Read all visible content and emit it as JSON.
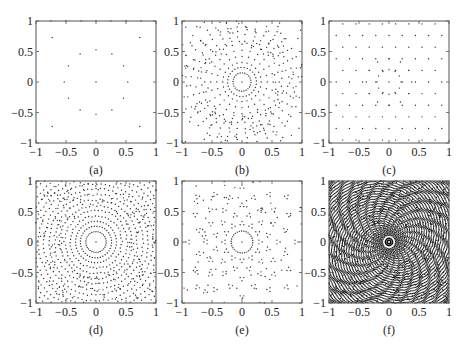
{
  "chart_data": [
    {
      "id": "a",
      "type": "scatter",
      "caption": "(a)",
      "xlim": [
        -1,
        1
      ],
      "ylim": [
        -1,
        1
      ],
      "xticks": [
        "-1",
        "-0.5",
        "0",
        "0.5",
        "1"
      ],
      "yticks": [
        "1",
        "0.5",
        "0",
        "-0.5",
        "-1"
      ],
      "grid": false,
      "description": "Center point, 12 points on ring r=0.53 at 30-degree spacing, 4 corner points",
      "points": [
        [
          0,
          0
        ],
        [
          0,
          0.53
        ],
        [
          0.265,
          0.459
        ],
        [
          0.459,
          0.265
        ],
        [
          0.53,
          0
        ],
        [
          0.459,
          -0.265
        ],
        [
          0.265,
          -0.459
        ],
        [
          0,
          -0.53
        ],
        [
          -0.265,
          -0.459
        ],
        [
          -0.459,
          -0.265
        ],
        [
          -0.53,
          0
        ],
        [
          -0.459,
          0.265
        ],
        [
          -0.265,
          0.459
        ],
        [
          0.73,
          0.73
        ],
        [
          -0.73,
          0.73
        ],
        [
          0.73,
          -0.73
        ],
        [
          -0.73,
          -0.73
        ],
        [
          -0.5,
          1
        ],
        [
          0,
          1
        ],
        [
          0.5,
          1
        ],
        [
          -0.25,
          1
        ],
        [
          0.25,
          1
        ],
        [
          -0.75,
          1
        ],
        [
          0.75,
          1
        ]
      ],
      "pattern": {
        "kind": "explicit"
      }
    },
    {
      "id": "b",
      "type": "scatter",
      "caption": "(b)",
      "xlim": [
        -1,
        1
      ],
      "ylim": [
        -1,
        1
      ],
      "xticks": [
        "-1",
        "-0.5",
        "0",
        "0.5",
        "1"
      ],
      "yticks": [
        "1",
        "0.5",
        "0",
        "-0.5",
        "-1"
      ],
      "grid": false,
      "description": "Center point, dense inner ring, radial spokes, outer scattered points",
      "pattern": {
        "kind": "rings_spokes",
        "rings": [
          [
            0.15,
            24
          ],
          [
            0.24,
            28
          ]
        ],
        "spokes": 24,
        "spoke_r": [
          0.32,
          0.62
        ],
        "spoke_pts": 4,
        "outer_spokes": 36,
        "outer_r": [
          0.68,
          1.0
        ],
        "outer_pts": 5,
        "scatter": 180,
        "seed": 7
      }
    },
    {
      "id": "c",
      "type": "scatter",
      "caption": "(c)",
      "xlim": [
        -1,
        1
      ],
      "ylim": [
        -1,
        1
      ],
      "xticks": [
        "-1",
        "-0.5",
        "0",
        "0.5",
        "1"
      ],
      "yticks": [
        "1",
        "0.5",
        "0",
        "-0.5",
        "-1"
      ],
      "grid": false,
      "description": "Sparse quasi-periodic 12-fold point pattern",
      "pattern": {
        "kind": "quasi",
        "step": 0.22,
        "fold": 12,
        "seed": 3
      }
    },
    {
      "id": "d",
      "type": "scatter",
      "caption": "(d)",
      "xlim": [
        -1,
        1
      ],
      "ylim": [
        -1,
        1
      ],
      "xticks": [
        "-1",
        "-0.5",
        "0",
        "0.5",
        "1"
      ],
      "yticks": [
        "1",
        "0.5",
        "0",
        "-0.5",
        "-1"
      ],
      "grid": false,
      "description": "Concentric rings of points with increasing density outward",
      "pattern": {
        "kind": "rings_spokes",
        "rings": [
          [
            0.17,
            30
          ],
          [
            0.26,
            36
          ],
          [
            0.34,
            42
          ],
          [
            0.43,
            48
          ],
          [
            0.52,
            54
          ],
          [
            0.6,
            60
          ],
          [
            0.69,
            66
          ],
          [
            0.78,
            72
          ],
          [
            0.87,
            78
          ],
          [
            0.96,
            84
          ],
          [
            1.05,
            90
          ],
          [
            1.14,
            96
          ],
          [
            1.23,
            100
          ],
          [
            1.32,
            104
          ]
        ],
        "spokes": 0,
        "scatter": 260,
        "seed": 11
      }
    },
    {
      "id": "e",
      "type": "scatter",
      "caption": "(e)",
      "xlim": [
        -1,
        1
      ],
      "ylim": [
        -1,
        1
      ],
      "xticks": [
        "-1",
        "-0.5",
        "0",
        "0.5",
        "1"
      ],
      "yticks": [
        "1",
        "0.5",
        "0",
        "-0.5",
        "-1"
      ],
      "grid": false,
      "description": "Center point with ring r=0.18, outer clustered triplets in 12-fold symmetry",
      "pattern": {
        "kind": "rings_spokes",
        "rings": [
          [
            0.18,
            30
          ]
        ],
        "spokes": 0,
        "clusters": 12,
        "cluster_r": [
          0.3,
          0.45,
          0.6,
          0.75,
          0.9,
          1.05,
          1.2
        ],
        "scatter": 90,
        "seed": 5
      }
    },
    {
      "id": "f",
      "type": "scatter",
      "caption": "(f)",
      "xlim": [
        -1,
        1
      ],
      "ylim": [
        -1,
        1
      ],
      "xticks": [
        "-1",
        "-0.5",
        "0",
        "0.5",
        "1"
      ],
      "yticks": [
        "1",
        "0.5",
        "0",
        "-0.5",
        "-1"
      ],
      "grid": false,
      "description": "Very dense pattern with concentric rings, dark center rings and radial spokes",
      "pattern": {
        "kind": "dense",
        "center_rings": [
          0.03,
          0.06
        ],
        "spokes": 48,
        "spoke_r": [
          0.1,
          0.3
        ],
        "rings_step": 0.035,
        "seed": 13
      }
    }
  ],
  "layout": {
    "panels": [
      {
        "x": 36,
        "y": 21,
        "w": 120,
        "h": 122
      },
      {
        "x": 182,
        "y": 21,
        "w": 120,
        "h": 122
      },
      {
        "x": 329,
        "y": 21,
        "w": 120,
        "h": 122
      },
      {
        "x": 36,
        "y": 181,
        "w": 120,
        "h": 122
      },
      {
        "x": 182,
        "y": 181,
        "w": 120,
        "h": 122
      },
      {
        "x": 329,
        "y": 181,
        "w": 120,
        "h": 122
      }
    ]
  }
}
